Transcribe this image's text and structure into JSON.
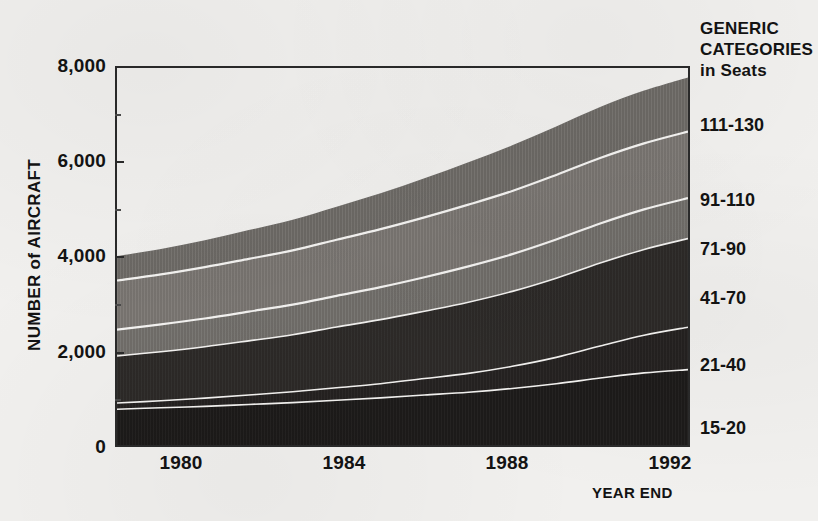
{
  "chart_data": {
    "type": "area",
    "title": "",
    "xlabel": "YEAR END",
    "ylabel": "NUMBER of AIRCRAFT",
    "xlim": [
      1979,
      1992
    ],
    "ylim": [
      0,
      8000
    ],
    "x": [
      1979,
      1980,
      1981,
      1982,
      1983,
      1984,
      1985,
      1986,
      1987,
      1988,
      1989,
      1990,
      1991,
      1992
    ],
    "x_ticks": [
      "1980",
      "1984",
      "1988",
      "1992"
    ],
    "y_ticks": [
      "0",
      "2,000",
      "4,000",
      "6,000",
      "8,000"
    ],
    "y_minor_ticks": [
      1000,
      3000,
      5000,
      7000
    ],
    "grid": false,
    "stacked": true,
    "legend_position": "right",
    "legend_title": [
      "GENERIC",
      "CATEGORIES",
      "in Seats"
    ],
    "series": [
      {
        "name": "15-20",
        "color": "#1c1a19",
        "values": [
          760,
          790,
          820,
          860,
          900,
          950,
          1000,
          1060,
          1120,
          1200,
          1300,
          1420,
          1530,
          1600
        ]
      },
      {
        "name": "21-40",
        "color": "#242120",
        "values": [
          130,
          150,
          175,
          200,
          230,
          265,
          300,
          350,
          400,
          470,
          560,
          680,
          800,
          900
        ]
      },
      {
        "name": "41-70",
        "color": "#2c2927",
        "values": [
          1000,
          1040,
          1090,
          1150,
          1210,
          1290,
          1360,
          1430,
          1510,
          1590,
          1680,
          1760,
          1820,
          1880
        ]
      },
      {
        "name": "71-90",
        "color": "#6f6c68",
        "values": [
          560,
          580,
          600,
          620,
          640,
          660,
          690,
          720,
          760,
          790,
          820,
          840,
          850,
          860
        ]
      },
      {
        "name": "91-110",
        "color": "#77736f",
        "values": [
          1040,
          1060,
          1090,
          1120,
          1150,
          1190,
          1230,
          1270,
          1310,
          1340,
          1370,
          1390,
          1400,
          1410
        ]
      },
      {
        "name": "111-130",
        "color": "#6b6864",
        "values": [
          520,
          540,
          570,
          610,
          650,
          700,
          760,
          830,
          900,
          970,
          1030,
          1080,
          1120,
          1150
        ]
      }
    ]
  },
  "axes": {
    "y_title": "NUMBER of AIRCRAFT",
    "x_title": "YEAR END",
    "y_tick_0": "0",
    "y_tick_2000": "2,000",
    "y_tick_4000": "4,000",
    "y_tick_6000": "6,000",
    "y_tick_8000": "8,000",
    "x_tick_1980": "1980",
    "x_tick_1984": "1984",
    "x_tick_1988": "1988",
    "x_tick_1992": "1992"
  },
  "legend": {
    "title_line_1": "GENERIC",
    "title_line_2": "CATEGORIES",
    "title_line_3": "in Seats",
    "entries": [
      {
        "label": "111-130"
      },
      {
        "label": "91-110"
      },
      {
        "label": "71-90"
      },
      {
        "label": "41-70"
      },
      {
        "label": "21-40"
      },
      {
        "label": "15-20"
      }
    ]
  },
  "colors": {
    "page_background": "#f1f0ee",
    "axis": "#2a2a2a",
    "text": "#131313",
    "band_separator": "#f4f3f1"
  }
}
